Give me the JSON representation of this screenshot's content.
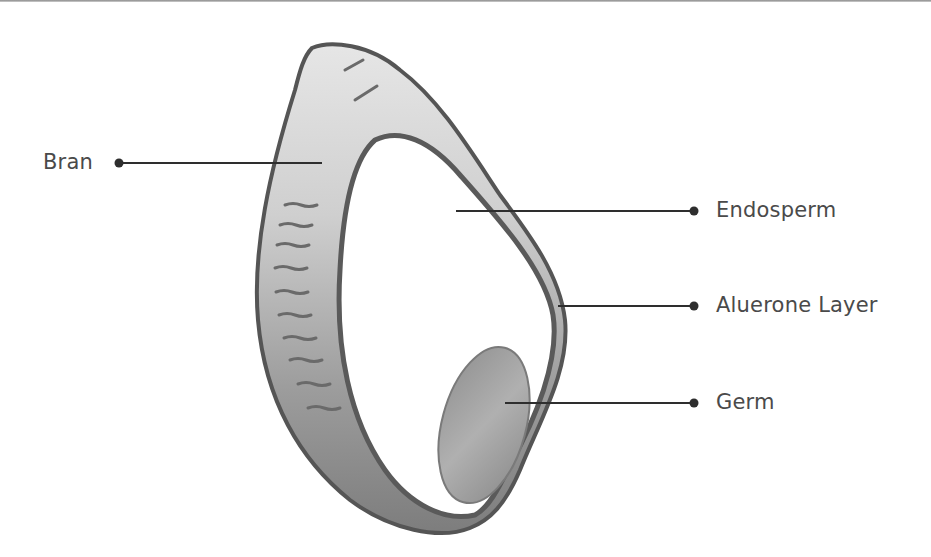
{
  "diagram": {
    "colors": {
      "line": "#2e2e2e",
      "text": "#4a4a4a",
      "bran_fill": "#a9a9a9",
      "bran_dark": "#6a6a6a",
      "germ_fill": "#9a9a9a",
      "background": "#ffffff"
    },
    "labels": [
      {
        "id": "bran",
        "text": "Bran",
        "side": "left"
      },
      {
        "id": "endosperm",
        "text": "Endosperm",
        "side": "right"
      },
      {
        "id": "aleurone",
        "text": "Aluerone Layer",
        "side": "right"
      },
      {
        "id": "germ",
        "text": "Germ",
        "side": "right"
      }
    ]
  }
}
